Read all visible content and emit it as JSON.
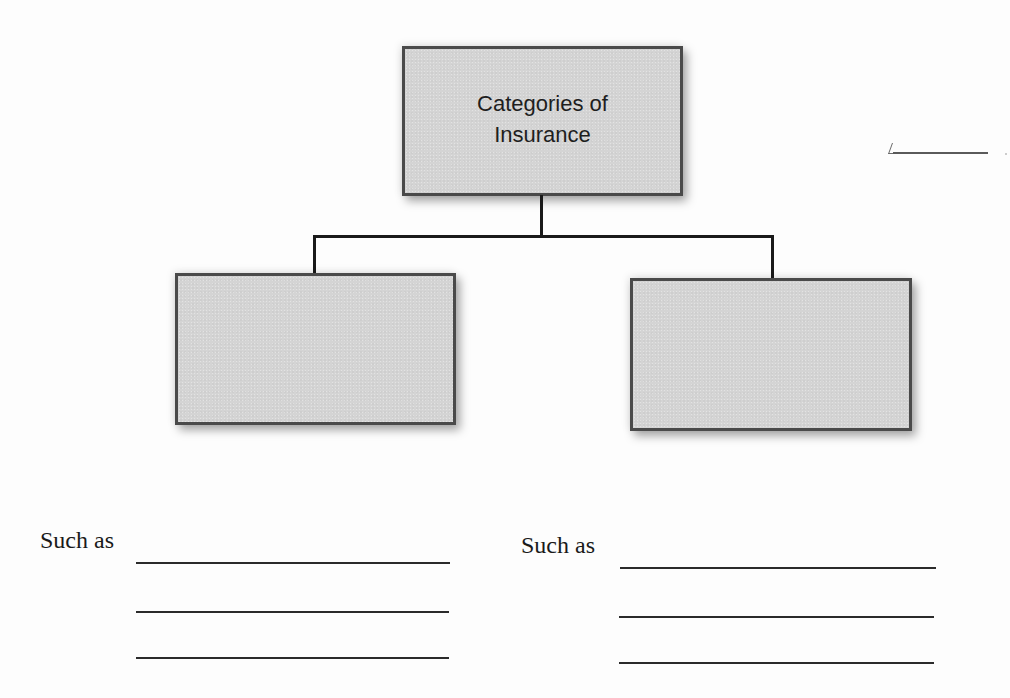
{
  "diagram": {
    "type": "hierarchy-graphic-organizer",
    "root": {
      "label_lines": [
        "Categories of",
        "Insurance"
      ],
      "fill": "#d4d4d4",
      "border": "#4a4a4a"
    },
    "children": [
      {
        "position": "left",
        "label_lines": [],
        "prompt": "Such as",
        "answer_blanks": 3
      },
      {
        "position": "right",
        "label_lines": [],
        "prompt": "Such as",
        "answer_blanks": 3
      }
    ],
    "connector_color": "#1a1a1a"
  },
  "left_branch": {
    "prompt": "Such as",
    "blanks": [
      {
        "x": 136,
        "y": 562,
        "width": 314
      },
      {
        "x": 136,
        "y": 611,
        "width": 313
      },
      {
        "x": 136,
        "y": 657,
        "width": 313
      }
    ]
  },
  "right_branch": {
    "prompt": "Such as",
    "blanks": [
      {
        "x": 620,
        "y": 567,
        "width": 316
      },
      {
        "x": 619,
        "y": 616,
        "width": 315
      },
      {
        "x": 619,
        "y": 662,
        "width": 315
      }
    ]
  },
  "edge_fragment": {
    "description": "partial answer blank at page edge"
  }
}
